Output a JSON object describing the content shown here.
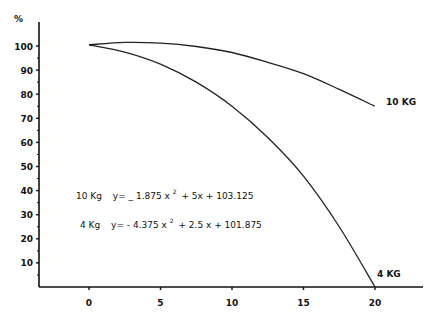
{
  "chart_data": {
    "type": "line",
    "title": "",
    "xlabel": "",
    "ylabel": "%",
    "xlim": [
      -3.5,
      23.5
    ],
    "ylim": [
      0,
      110
    ],
    "x_ticks": [
      0,
      5,
      10,
      15,
      20
    ],
    "x_tick_labels": [
      "0",
      "5",
      "10",
      "15",
      "20"
    ],
    "y_ticks": [
      10,
      20,
      30,
      40,
      50,
      60,
      70,
      80,
      90,
      100
    ],
    "y_tick_labels": [
      "10",
      "20",
      "30",
      "40",
      "50",
      "60",
      "70",
      "80",
      "90",
      "100"
    ],
    "grid": false,
    "series": [
      {
        "name": "10 KG",
        "label": "10 KG",
        "x": [
          0,
          2.5,
          5,
          7.5,
          10,
          12.5,
          15,
          17.5,
          20
        ],
        "values": [
          100.5,
          101.5,
          101.2,
          99.8,
          97.3,
          93.2,
          88.5,
          82,
          75
        ]
      },
      {
        "name": "4 KG",
        "label": "4 KG",
        "x": [
          0,
          2.5,
          5,
          7.5,
          10,
          12.5,
          15,
          17.5,
          20
        ],
        "values": [
          100.5,
          97.5,
          92.5,
          85,
          75,
          62,
          46,
          25,
          0
        ]
      }
    ],
    "annotations": [
      {
        "label": "10 Kg",
        "eq_prefix": "y= _ 1.875 x",
        "power": "2",
        "eq_suffix": "+ 5x + 103.125"
      },
      {
        "label": "4 Kg",
        "eq_prefix": "y= -  4.375 x",
        "power": "2",
        "eq_suffix": "+ 2.5 x + 101.875"
      }
    ]
  }
}
